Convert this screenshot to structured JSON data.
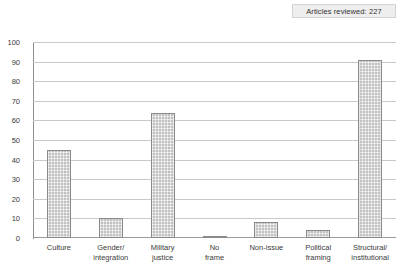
{
  "annotation": {
    "label": "Articles reviewed: 227"
  },
  "chart_data": {
    "type": "bar",
    "title": "",
    "xlabel": "",
    "ylabel": "",
    "ylim": [
      0,
      100
    ],
    "ytick_values": [
      0,
      10,
      20,
      30,
      40,
      50,
      60,
      70,
      80,
      90,
      100
    ],
    "ytick_labels": [
      "0",
      "10",
      "20",
      "30",
      "40",
      "50",
      "60",
      "70",
      "80",
      "90",
      "100"
    ],
    "grid": true,
    "legend": "none",
    "categories": [
      "Culture",
      "Gender/ integration",
      "Military justice",
      "No frame",
      "Non-issue",
      "Political framing",
      "Structural/ institutional"
    ],
    "category_lines": [
      [
        "Culture",
        ""
      ],
      [
        "Gender/",
        "integration"
      ],
      [
        "Military",
        "justice"
      ],
      [
        "No",
        "frame"
      ],
      [
        "Non-issue",
        ""
      ],
      [
        "Political",
        "framing"
      ],
      [
        "Structural/",
        "institutional"
      ]
    ],
    "values": [
      45,
      10,
      64,
      1,
      8,
      4,
      91
    ],
    "annotations": [
      "Articles reviewed: 227"
    ],
    "bar_color": "#c2c2c2",
    "bar_edge_color": "#8a8a8a",
    "grid_color": "#c9c9c9",
    "axis_color": "#8e8e8e"
  }
}
